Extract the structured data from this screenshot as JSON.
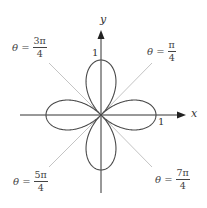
{
  "diagram": {
    "curve": "r = cos(2θ)",
    "colors": {
      "curve": "#4a4a4a",
      "axes": "#333333",
      "tangents": "#b5b5b5",
      "text": "#333333"
    },
    "axes": {
      "x_label": "x",
      "y_label": "y",
      "x_tick_label": "1",
      "y_tick_label": "1"
    },
    "tangent_lines": [
      {
        "id": "pi-over-4",
        "prefix": "θ =",
        "numerator": "π",
        "denominator": "4"
      },
      {
        "id": "3pi-over-4",
        "prefix": "θ =",
        "numerator": "3π",
        "denominator": "4"
      },
      {
        "id": "5pi-over-4",
        "prefix": "θ =",
        "numerator": "5π",
        "denominator": "4"
      },
      {
        "id": "7pi-over-4",
        "prefix": "θ =",
        "numerator": "7π",
        "denominator": "4"
      }
    ]
  }
}
